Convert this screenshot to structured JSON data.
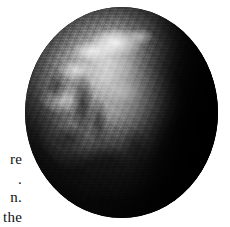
{
  "figure": {
    "type": "photograph",
    "rendering": "grayscale",
    "background_color": "#ffffff",
    "colors": {
      "highlight": "#f4f4f4",
      "landmass_midtone": "#a8a8a8",
      "ocean_shadow": "#161616",
      "night_side": "#050505",
      "page": "#ffffff",
      "text": "#111111"
    },
    "geometry": {
      "center_x": 121,
      "center_y": 112,
      "width": 193,
      "height": 211
    }
  },
  "margin_text": {
    "note": "right-hand remnants of a clipped body-text column at the left page edge",
    "lines": [
      {
        "id": "line-1",
        "text": "re"
      },
      {
        "id": "line-2",
        "text": "."
      },
      {
        "id": "line-3",
        "text": "n."
      },
      {
        "id": "line-4",
        "text": "the"
      }
    ]
  }
}
